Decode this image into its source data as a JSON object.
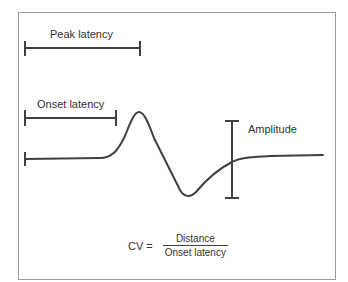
{
  "diagram": {
    "labels": {
      "peak_latency": "Peak latency",
      "onset_latency": "Onset latency",
      "amplitude": "Amplitude"
    },
    "formula": {
      "lhs": "CV =",
      "numerator": "Distance",
      "denominator": "Onset latency"
    },
    "colors": {
      "line": "#404040",
      "frame": "#9a9a9a",
      "text": "#333333"
    }
  }
}
